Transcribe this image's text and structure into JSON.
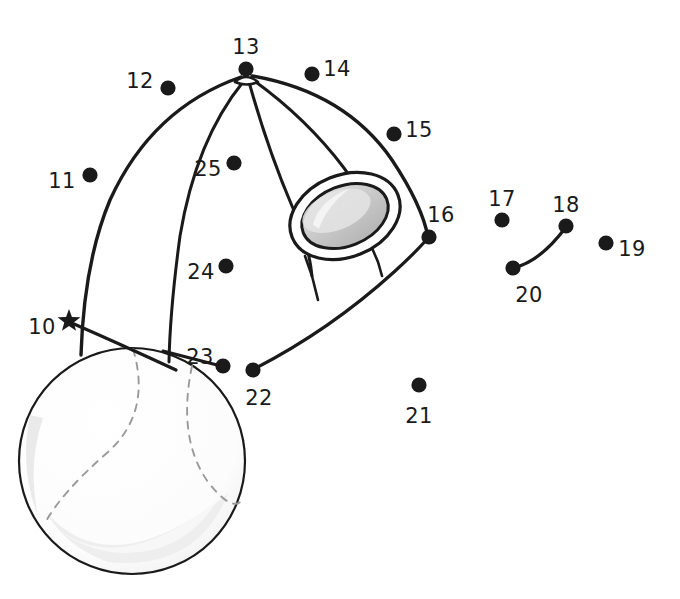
{
  "puzzle": {
    "type": "connect-the-dots",
    "subject": "baseball cap and baseball",
    "background_color": "#ffffff",
    "ink_color": "#1a1a1a",
    "dot_color": "#1a1a1a",
    "patch_color": "#c8c8c8",
    "patch_highlight_color": "#e0e0e0",
    "seam_color": "#9a9a9a",
    "shade_color": "#f2f2f2"
  },
  "dots": [
    {
      "number": "10",
      "x": 69,
      "y": 321,
      "marker": "star",
      "label_x": 42,
      "label_y": 328
    },
    {
      "number": "11",
      "x": 90,
      "y": 175,
      "marker": "circle",
      "label_x": 62,
      "label_y": 182
    },
    {
      "number": "12",
      "x": 168,
      "y": 88,
      "marker": "circle",
      "label_x": 140,
      "label_y": 82
    },
    {
      "number": "13",
      "x": 246,
      "y": 69,
      "marker": "circle",
      "label_x": 246,
      "label_y": 48
    },
    {
      "number": "14",
      "x": 312,
      "y": 74,
      "marker": "circle",
      "label_x": 337,
      "label_y": 70
    },
    {
      "number": "15",
      "x": 394,
      "y": 134,
      "marker": "circle",
      "label_x": 419,
      "label_y": 131
    },
    {
      "number": "16",
      "x": 429,
      "y": 237,
      "marker": "circle",
      "label_x": 441,
      "label_y": 216
    },
    {
      "number": "17",
      "x": 502,
      "y": 220,
      "marker": "circle",
      "label_x": 502,
      "label_y": 200
    },
    {
      "number": "18",
      "x": 566,
      "y": 226,
      "marker": "circle",
      "label_x": 566,
      "label_y": 206
    },
    {
      "number": "19",
      "x": 606,
      "y": 243,
      "marker": "circle",
      "label_x": 632,
      "label_y": 250
    },
    {
      "number": "20",
      "x": 513,
      "y": 268,
      "marker": "circle",
      "label_x": 529,
      "label_y": 296
    },
    {
      "number": "21",
      "x": 419,
      "y": 385,
      "marker": "circle",
      "label_x": 419,
      "label_y": 417
    },
    {
      "number": "22",
      "x": 253,
      "y": 370,
      "marker": "circle",
      "label_x": 259,
      "label_y": 399
    },
    {
      "number": "23",
      "x": 223,
      "y": 366,
      "marker": "circle",
      "label_x": 200,
      "label_y": 358
    },
    {
      "number": "24",
      "x": 226,
      "y": 266,
      "marker": "circle",
      "label_x": 201,
      "label_y": 273
    },
    {
      "number": "25",
      "x": 234,
      "y": 163,
      "marker": "circle",
      "label_x": 208,
      "label_y": 170
    }
  ],
  "drawn_segments": [
    {
      "name": "segment-17-to-20-to-18",
      "from": "17",
      "to": "18",
      "via": "20"
    }
  ],
  "ball": {
    "name": "baseball",
    "center_x": 132,
    "center_y": 461,
    "radius": 113
  },
  "cap": {
    "name": "baseball-cap",
    "crown_top_x": 246,
    "crown_top_y": 76,
    "panel_count": 5,
    "logo_patch": {
      "name": "cap-logo-patch",
      "center_x": 345,
      "center_y": 216,
      "rx": 56,
      "ry": 39,
      "rotation": -22
    }
  }
}
